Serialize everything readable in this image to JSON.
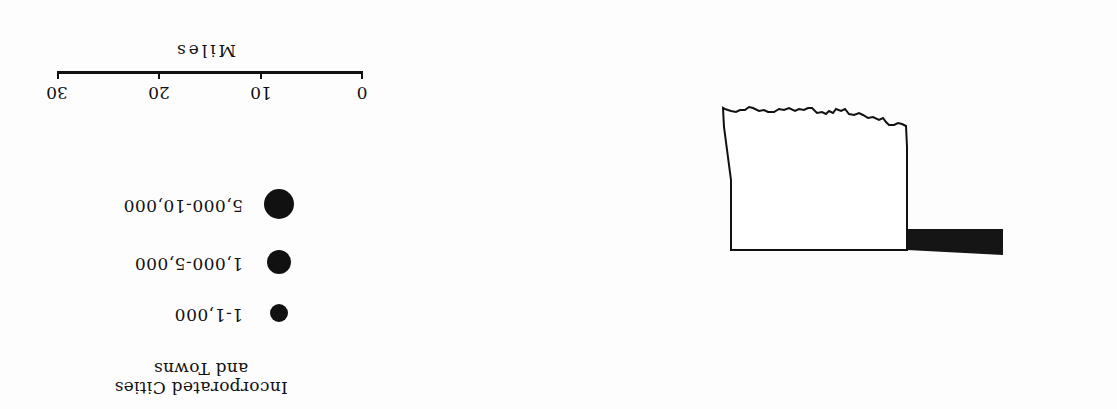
{
  "legend": {
    "title_line1": "Incorporated Cities",
    "title_line2": "and Towns",
    "items": [
      {
        "label": "1-1,000",
        "symbol": "small-dot",
        "radius": 9
      },
      {
        "label": "1,000-5,000",
        "symbol": "medium-dot",
        "radius": 12
      },
      {
        "label": "5,000-10,000",
        "symbol": "large-dot",
        "radius": 15
      }
    ]
  },
  "scale_bar": {
    "unit_label": "Miles",
    "ticks": [
      "0",
      "10",
      "20",
      "30"
    ]
  },
  "map": {
    "outline_color": "#111111",
    "panhandle_fill": "#151515",
    "orientation": "rotated-180"
  }
}
